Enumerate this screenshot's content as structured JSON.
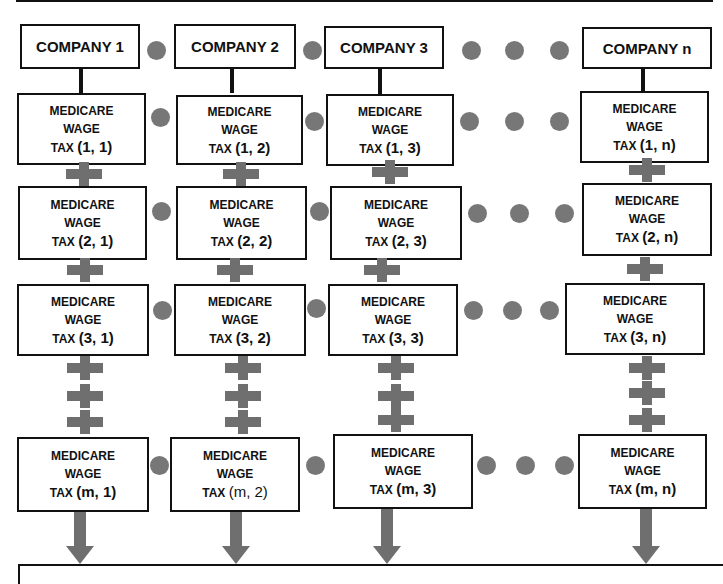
{
  "companies": [
    {
      "label": "COMPANY 1"
    },
    {
      "label": "COMPANY 2"
    },
    {
      "label": "COMPANY 3"
    },
    {
      "label": "COMPANY n"
    }
  ],
  "cell_text": {
    "line1": "MEDICARE",
    "line2": "WAGE",
    "line3_prefix": "TAX"
  },
  "rows": [
    {
      "cells": [
        "(1, 1)",
        "(1, 2)",
        "(1, 3)",
        "(1, n)"
      ]
    },
    {
      "cells": [
        "(2, 1)",
        "(2, 2)",
        "(2, 3)",
        "(2, n)"
      ]
    },
    {
      "cells": [
        "(3, 1)",
        "(3, 2)",
        "(3, 3)",
        "(3, n)"
      ]
    },
    {
      "cells": [
        "(m, 1)",
        "(m, 2)",
        "(m, 3)",
        "(m, n)"
      ]
    }
  ],
  "colors": {
    "box_border": "#111111",
    "dot": "#777777",
    "plus": "#6f6f6f",
    "arrow": "#6f6f6f"
  }
}
